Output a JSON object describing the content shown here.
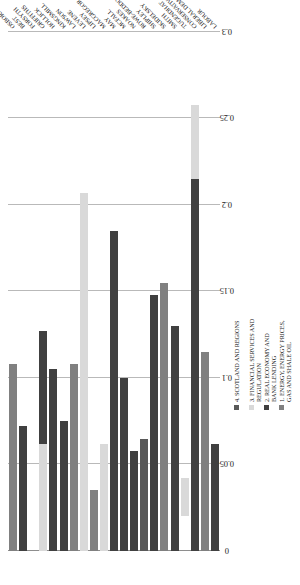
{
  "chart_data": {
    "type": "bar",
    "orientation": "horizontal",
    "title": "",
    "subtitle": "",
    "xlabel": "",
    "ylabel": "",
    "xlim": [
      0,
      0.3
    ],
    "grid": true,
    "gridlines_axis": "x",
    "legend_position": "bottom-right",
    "stacked": true,
    "xticks": [
      "0",
      "0.05",
      "0.1",
      "0.15",
      "0.2",
      "0.25",
      "0.3"
    ],
    "xtick_values": [
      0,
      0.05,
      0.1,
      0.15,
      0.2,
      0.25,
      0.3
    ],
    "categories": [
      "OSBORNE",
      "BEST",
      "FORSYTH",
      "GRIFFITHS",
      "HOLLICK",
      "KINGSMILL",
      "LAWSON",
      "LEVENE",
      "LIPSEY",
      "MACGREGOR",
      "MAY",
      "MCFALL",
      "NOAKES",
      "ROWE-BEDDOE",
      "SHIPLEY",
      "SKIDELSKY",
      "SMITH",
      "TUGENDHAT",
      "CONSERVATIVE",
      "LIBERAL DEMOCRAT",
      "LABOUR"
    ],
    "series": [
      {
        "name": "1. ENERGY, ENERGY PRICES, GAS AND SHALE OIL",
        "color": "#808080",
        "values": [
          0.108,
          0,
          0,
          0,
          0,
          0,
          0.108,
          0,
          0.035,
          0,
          0,
          0,
          0,
          0,
          0,
          0.155,
          0,
          0.065,
          0,
          0.115,
          0
        ]
      },
      {
        "name": "2. REAL ECONOMY AND BANK LENDING",
        "color": "#404040",
        "values": [
          0,
          0.072,
          0,
          0.127,
          0.105,
          0.075,
          0,
          0,
          0,
          0,
          0.185,
          0.1,
          0.058,
          0,
          0.148,
          0,
          0.13,
          0,
          0.215,
          0,
          0.062
        ]
      },
      {
        "name": "3. FINANCIAL SERVICES AND REGULATION",
        "color": "#d9d9d9",
        "values": [
          0,
          0,
          0,
          0.062,
          0,
          0,
          0,
          0.207,
          0,
          0.062,
          0,
          0,
          0,
          0,
          0,
          0,
          0,
          0,
          0.043,
          0,
          0
        ]
      },
      {
        "name": "4. SCOTLAND AND REGIONS",
        "color": "#595959",
        "values": [
          0,
          0,
          0,
          0,
          0,
          0,
          0,
          0,
          0,
          0,
          0,
          0,
          0,
          0.065,
          0,
          0,
          0,
          0,
          0,
          0,
          0
        ]
      }
    ],
    "bar_totals": [
      0.108,
      0.072,
      0.0,
      0.127,
      0.105,
      0.075,
      0.108,
      0.207,
      0.035,
      0.062,
      0.185,
      0.1,
      0.058,
      0.065,
      0.148,
      0.155,
      0.13,
      0.065,
      0.258,
      0.115,
      0.062
    ],
    "bars": [
      {
        "category": "OSBORNE",
        "segments": [
          {
            "series": 0,
            "start": 0.0,
            "end": 0.108
          }
        ]
      },
      {
        "category": "BEST",
        "segments": [
          {
            "series": 1,
            "start": 0.0,
            "end": 0.072
          }
        ]
      },
      {
        "category": "FORSYTH",
        "segments": []
      },
      {
        "category": "GRIFFITHS",
        "segments": [
          {
            "series": 2,
            "start": 0.0,
            "end": 0.062
          },
          {
            "series": 1,
            "start": 0.062,
            "end": 0.127
          }
        ]
      },
      {
        "category": "HOLLICK",
        "segments": [
          {
            "series": 1,
            "start": 0.0,
            "end": 0.105
          }
        ]
      },
      {
        "category": "KINGSMILL",
        "segments": [
          {
            "series": 1,
            "start": 0.0,
            "end": 0.075
          }
        ]
      },
      {
        "category": "LAWSON",
        "segments": [
          {
            "series": 0,
            "start": 0.0,
            "end": 0.108
          }
        ]
      },
      {
        "category": "LEVENE",
        "segments": [
          {
            "series": 2,
            "start": 0.0,
            "end": 0.207
          }
        ]
      },
      {
        "category": "LIPSEY",
        "segments": [
          {
            "series": 0,
            "start": 0.0,
            "end": 0.035
          }
        ]
      },
      {
        "category": "MACGREGOR",
        "segments": [
          {
            "series": 2,
            "start": 0.0,
            "end": 0.062
          }
        ]
      },
      {
        "category": "MAY",
        "segments": [
          {
            "series": 1,
            "start": 0.0,
            "end": 0.185
          }
        ]
      },
      {
        "category": "MCFALL",
        "segments": [
          {
            "series": 1,
            "start": 0.0,
            "end": 0.1
          }
        ]
      },
      {
        "category": "NOAKES",
        "segments": [
          {
            "series": 1,
            "start": 0.0,
            "end": 0.058
          }
        ]
      },
      {
        "category": "ROWE-BEDDOE",
        "segments": [
          {
            "series": 3,
            "start": 0.0,
            "end": 0.065
          }
        ]
      },
      {
        "category": "SHIPLEY",
        "segments": [
          {
            "series": 1,
            "start": 0.0,
            "end": 0.148
          }
        ]
      },
      {
        "category": "SKIDELSKY",
        "segments": [
          {
            "series": 0,
            "start": 0.0,
            "end": 0.155
          }
        ]
      },
      {
        "category": "SMITH",
        "segments": [
          {
            "series": 1,
            "start": 0.0,
            "end": 0.13
          }
        ]
      },
      {
        "category": "TUGENDHAT",
        "segments": [
          {
            "series": 2,
            "start": 0.02,
            "end": 0.042
          }
        ]
      },
      {
        "category": "CONSERVATIVE",
        "segments": [
          {
            "series": 1,
            "start": 0.0,
            "end": 0.215
          },
          {
            "series": 2,
            "start": 0.215,
            "end": 0.258
          }
        ]
      },
      {
        "category": "LIBERAL DEMOCRAT",
        "segments": [
          {
            "series": 0,
            "start": 0.0,
            "end": 0.115
          }
        ]
      },
      {
        "category": "LABOUR",
        "segments": [
          {
            "series": 1,
            "start": 0.0,
            "end": 0.062
          }
        ]
      }
    ]
  },
  "legend": {
    "items": [
      {
        "label": "4. SCOTLAND AND REGIONS",
        "color": "#595959"
      },
      {
        "label": "3. FINANCIAL SERVICES AND REGULATION",
        "color": "#d9d9d9"
      },
      {
        "label": "2. REAL ECONOMY AND BANK LENDING",
        "color": "#404040"
      },
      {
        "label": "1. ENERGY, ENERGY PRICES, GAS AND SHALE OIL",
        "color": "#808080"
      }
    ]
  }
}
